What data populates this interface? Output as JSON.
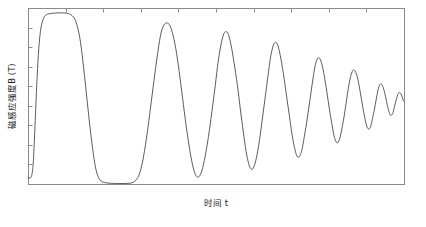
{
  "figure": {
    "width": 426,
    "height": 227,
    "background": "#ffffff",
    "line_color": "#4a4a4a",
    "frame_color": "#8a8a8a",
    "text_color": "#1a1a1a"
  },
  "plot_area": {
    "left": 28,
    "top": 8,
    "right": 404,
    "bottom": 184
  },
  "labels": {
    "ylabel": "磁感应强度B (T)",
    "ylabel_main": "磁感应强度",
    "ylabel_symbol": "B",
    "ylabel_unit": "(T)",
    "xlabel_main": "时间",
    "xlabel_symbol": "t",
    "xlabel": "时间 t"
  },
  "axes": {
    "y_tick_count": 8,
    "x_tick_count": 9,
    "y_ticks_side": "left",
    "x_ticks_side": "top",
    "tick_length": 4,
    "tick_labels_visible": false,
    "grid": false
  },
  "chart_data": {
    "type": "line",
    "title": "",
    "xlabel": "时间 t",
    "ylabel": "磁感应强度B (T)",
    "xlim": [
      0,
      100
    ],
    "ylim": [
      0,
      1
    ],
    "xtick_labels": [],
    "ytick_labels": [],
    "legend": [],
    "series": [
      {
        "name": "磁感应强度B",
        "description": "Damped oscillation: initial flat-topped saturation pulse followed by ringing oscillation of decaying amplitude and shortening period, converging to a steady mid-level value.",
        "comment": "x,y pairs sampled in data units; x from 0 to 100, y from 0 (bottom) to 1 (top)",
        "points": [
          [
            0.0,
            0.035
          ],
          [
            0.6,
            0.035
          ],
          [
            1.0,
            0.05
          ],
          [
            1.4,
            0.12
          ],
          [
            1.8,
            0.3
          ],
          [
            2.3,
            0.55
          ],
          [
            2.8,
            0.75
          ],
          [
            3.4,
            0.88
          ],
          [
            4.2,
            0.945
          ],
          [
            5.2,
            0.965
          ],
          [
            6.5,
            0.97
          ],
          [
            8.0,
            0.972
          ],
          [
            9.5,
            0.972
          ],
          [
            10.8,
            0.968
          ],
          [
            11.8,
            0.955
          ],
          [
            12.6,
            0.93
          ],
          [
            13.3,
            0.88
          ],
          [
            14.0,
            0.8
          ],
          [
            14.8,
            0.66
          ],
          [
            15.6,
            0.5
          ],
          [
            16.4,
            0.34
          ],
          [
            17.2,
            0.2
          ],
          [
            17.9,
            0.1
          ],
          [
            18.6,
            0.045
          ],
          [
            19.4,
            0.018
          ],
          [
            20.4,
            0.008
          ],
          [
            22.0,
            0.004
          ],
          [
            24.0,
            0.003
          ],
          [
            26.0,
            0.003
          ],
          [
            27.5,
            0.006
          ],
          [
            28.5,
            0.018
          ],
          [
            29.4,
            0.045
          ],
          [
            30.2,
            0.1
          ],
          [
            31.0,
            0.19
          ],
          [
            31.9,
            0.32
          ],
          [
            32.8,
            0.47
          ],
          [
            33.7,
            0.62
          ],
          [
            34.6,
            0.76
          ],
          [
            35.4,
            0.86
          ],
          [
            36.2,
            0.905
          ],
          [
            36.9,
            0.915
          ],
          [
            37.6,
            0.905
          ],
          [
            38.4,
            0.86
          ],
          [
            39.3,
            0.77
          ],
          [
            40.2,
            0.64
          ],
          [
            41.1,
            0.49
          ],
          [
            42.0,
            0.34
          ],
          [
            42.9,
            0.21
          ],
          [
            43.7,
            0.115
          ],
          [
            44.4,
            0.06
          ],
          [
            45.0,
            0.04
          ],
          [
            45.6,
            0.045
          ],
          [
            46.3,
            0.08
          ],
          [
            47.1,
            0.155
          ],
          [
            48.0,
            0.27
          ],
          [
            48.9,
            0.41
          ],
          [
            49.8,
            0.56
          ],
          [
            50.6,
            0.7
          ],
          [
            51.4,
            0.8
          ],
          [
            52.1,
            0.855
          ],
          [
            52.7,
            0.865
          ],
          [
            53.3,
            0.85
          ],
          [
            54.0,
            0.79
          ],
          [
            54.8,
            0.69
          ],
          [
            55.7,
            0.56
          ],
          [
            56.5,
            0.42
          ],
          [
            57.3,
            0.29
          ],
          [
            58.0,
            0.185
          ],
          [
            58.7,
            0.115
          ],
          [
            59.3,
            0.085
          ],
          [
            59.9,
            0.09
          ],
          [
            60.6,
            0.135
          ],
          [
            61.4,
            0.225
          ],
          [
            62.2,
            0.35
          ],
          [
            63.0,
            0.48
          ],
          [
            63.8,
            0.61
          ],
          [
            64.5,
            0.72
          ],
          [
            65.2,
            0.785
          ],
          [
            65.8,
            0.805
          ],
          [
            66.4,
            0.79
          ],
          [
            67.1,
            0.73
          ],
          [
            67.9,
            0.63
          ],
          [
            68.7,
            0.51
          ],
          [
            69.5,
            0.39
          ],
          [
            70.2,
            0.285
          ],
          [
            70.9,
            0.205
          ],
          [
            71.5,
            0.16
          ],
          [
            72.1,
            0.155
          ],
          [
            72.8,
            0.19
          ],
          [
            73.5,
            0.27
          ],
          [
            74.3,
            0.375
          ],
          [
            75.0,
            0.48
          ],
          [
            75.7,
            0.585
          ],
          [
            76.3,
            0.665
          ],
          [
            76.9,
            0.71
          ],
          [
            77.5,
            0.715
          ],
          [
            78.1,
            0.685
          ],
          [
            78.8,
            0.615
          ],
          [
            79.5,
            0.52
          ],
          [
            80.2,
            0.42
          ],
          [
            80.9,
            0.33
          ],
          [
            81.5,
            0.265
          ],
          [
            82.1,
            0.235
          ],
          [
            82.7,
            0.245
          ],
          [
            83.3,
            0.295
          ],
          [
            84.0,
            0.375
          ],
          [
            84.6,
            0.46
          ],
          [
            85.2,
            0.545
          ],
          [
            85.8,
            0.61
          ],
          [
            86.4,
            0.645
          ],
          [
            86.9,
            0.645
          ],
          [
            87.5,
            0.615
          ],
          [
            88.1,
            0.555
          ],
          [
            88.7,
            0.48
          ],
          [
            89.3,
            0.405
          ],
          [
            89.9,
            0.345
          ],
          [
            90.4,
            0.315
          ],
          [
            91.0,
            0.32
          ],
          [
            91.5,
            0.36
          ],
          [
            92.1,
            0.42
          ],
          [
            92.6,
            0.48
          ],
          [
            93.1,
            0.535
          ],
          [
            93.6,
            0.565
          ],
          [
            94.1,
            0.565
          ],
          [
            94.6,
            0.54
          ],
          [
            95.1,
            0.495
          ],
          [
            95.6,
            0.445
          ],
          [
            96.1,
            0.405
          ],
          [
            96.5,
            0.39
          ],
          [
            97.0,
            0.4
          ],
          [
            97.4,
            0.435
          ],
          [
            97.9,
            0.475
          ],
          [
            98.3,
            0.505
          ],
          [
            98.7,
            0.52
          ],
          [
            99.1,
            0.515
          ],
          [
            99.5,
            0.495
          ],
          [
            99.8,
            0.475
          ],
          [
            100.0,
            0.47
          ]
        ]
      }
    ]
  }
}
